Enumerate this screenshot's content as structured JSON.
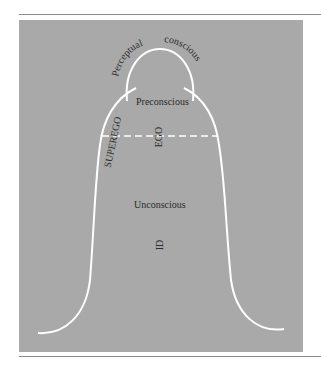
{
  "diagram": {
    "labels": {
      "perceptual": "Perceptual",
      "conscious": "conscious",
      "preconscious": "Preconscious",
      "superego": "SUPEREGO",
      "ego": "EGO",
      "unconscious": "Unconscious",
      "id": "ID"
    },
    "colors": {
      "background": "#a9a9a9",
      "lines": "#ffffff",
      "text": "#2a2a2a",
      "rule": "#8a8a8a"
    }
  }
}
